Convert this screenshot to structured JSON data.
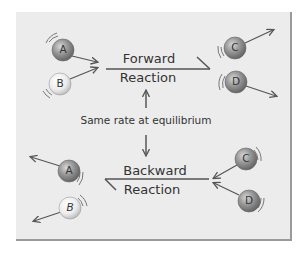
{
  "diagram": {
    "forward": {
      "line1": "Forward",
      "line2": "Reaction"
    },
    "backward": {
      "line1": "Backward",
      "line2": "Reaction"
    },
    "equilibrium_label": "Same rate at equilibrium",
    "molecules": {
      "top": [
        {
          "letter": "A",
          "shade": "dark"
        },
        {
          "letter": "B",
          "shade": "light"
        },
        {
          "letter": "C",
          "shade": "dark"
        },
        {
          "letter": "D",
          "shade": "dark"
        }
      ],
      "bottom": [
        {
          "letter": "A",
          "shade": "dark"
        },
        {
          "letter": "B",
          "shade": "light"
        },
        {
          "letter": "C",
          "shade": "dark"
        },
        {
          "letter": "D",
          "shade": "dark"
        }
      ]
    },
    "colors": {
      "panel": "#ececec",
      "panel_edge": "#9a9a9a",
      "line": "#555555",
      "dark_sphere": "#8a8a8a",
      "light_sphere": "#e6e6e6",
      "text": "#333333"
    }
  }
}
